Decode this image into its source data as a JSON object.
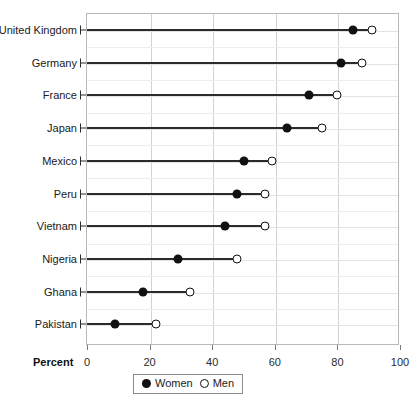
{
  "chart_data": {
    "type": "scatter",
    "subtype": "dumbbell",
    "title": "",
    "xlabel": "Percent",
    "ylabel": "",
    "xlim": [
      0,
      100
    ],
    "xticks": [
      0,
      20,
      40,
      60,
      80,
      100
    ],
    "grid": true,
    "legend_position": "bottom",
    "categories": [
      "United Kingdom",
      "Germany",
      "France",
      "Japan",
      "Mexico",
      "Peru",
      "Vietnam",
      "Nigeria",
      "Ghana",
      "Pakistan"
    ],
    "series": [
      {
        "name": "Women",
        "marker": "filled-circle",
        "color": "#111111",
        "values": [
          85,
          81,
          71,
          64,
          50,
          48,
          44,
          29,
          18,
          9
        ]
      },
      {
        "name": "Men",
        "marker": "open-circle",
        "color": "#111111",
        "values": [
          91,
          88,
          80,
          75,
          59,
          57,
          57,
          48,
          33,
          22
        ]
      }
    ]
  },
  "axis": {
    "title": "Percent",
    "tick_labels": [
      "0",
      "20",
      "40",
      "60",
      "80",
      "100"
    ]
  },
  "legend": {
    "items": [
      {
        "label": "Women",
        "marker": "filled-circle"
      },
      {
        "label": "Men",
        "marker": "open-circle"
      }
    ]
  }
}
